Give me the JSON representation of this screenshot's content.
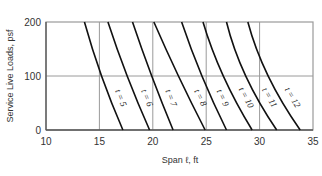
{
  "chart_data": {
    "type": "line",
    "title": "",
    "xlabel": "Span ℓ, ft",
    "ylabel": "Service Live Loads, psf",
    "xlim": [
      10,
      35
    ],
    "ylim": [
      0,
      200
    ],
    "x_ticks": [
      10,
      15,
      20,
      25,
      30,
      35
    ],
    "y_ticks": [
      0,
      100,
      200
    ],
    "grid": true,
    "legend": "inline curve labels",
    "series": [
      {
        "name": "t = 5",
        "points": [
          [
            13.6,
            200
          ],
          [
            15.2,
            100
          ],
          [
            17.2,
            0
          ]
        ]
      },
      {
        "name": "t = 6",
        "points": [
          [
            15.8,
            200
          ],
          [
            17.6,
            100
          ],
          [
            19.7,
            0
          ]
        ]
      },
      {
        "name": "t = 7",
        "points": [
          [
            18.1,
            200
          ],
          [
            19.9,
            100
          ],
          [
            21.9,
            0
          ]
        ]
      },
      {
        "name": "t = 8",
        "points": [
          [
            20.1,
            200
          ],
          [
            22.4,
            100
          ],
          [
            24.9,
            0
          ]
        ]
      },
      {
        "name": "t = 9",
        "points": [
          [
            22.7,
            200
          ],
          [
            24.6,
            100
          ],
          [
            26.9,
            0
          ]
        ]
      },
      {
        "name": "t = 10",
        "points": [
          [
            24.7,
            200
          ],
          [
            26.6,
            100
          ],
          [
            29.3,
            0
          ]
        ]
      },
      {
        "name": "t = 11",
        "points": [
          [
            26.9,
            200
          ],
          [
            28.7,
            100
          ],
          [
            31.6,
            0
          ]
        ]
      },
      {
        "name": "t = 12",
        "points": [
          [
            28.9,
            200
          ],
          [
            30.8,
            100
          ],
          [
            33.8,
            0
          ]
        ]
      }
    ]
  },
  "plot": {
    "left": 46,
    "right": 313,
    "top": 22,
    "bottom": 130,
    "grid_color": "#9a9a9a",
    "frame_color": "#9a9a9a",
    "curve_color": "#111111"
  }
}
